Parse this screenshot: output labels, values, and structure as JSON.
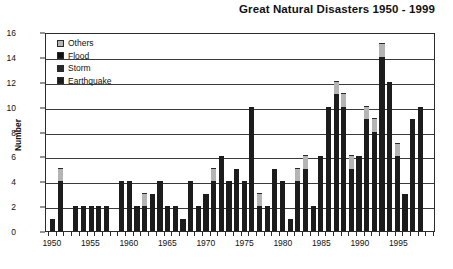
{
  "chart_data": {
    "type": "bar",
    "title": "Great Natural Disasters 1950 - 1999",
    "xlabel": "",
    "ylabel": "Number",
    "ylim": [
      0,
      16
    ],
    "ytick_step": 2,
    "yticks": [
      "16",
      "14",
      "12",
      "10",
      "8",
      "6",
      "4",
      "2",
      "0"
    ],
    "xticks": [
      "1950",
      "1955",
      "1960",
      "1965",
      "1970",
      "1975",
      "1980",
      "1985",
      "1990",
      "1995"
    ],
    "grid": true,
    "legend_position": "upper-left-inside",
    "stacked": true,
    "categories": [
      "1950",
      "1951",
      "1952",
      "1953",
      "1954",
      "1955",
      "1956",
      "1957",
      "1958",
      "1959",
      "1960",
      "1961",
      "1962",
      "1963",
      "1964",
      "1965",
      "1966",
      "1967",
      "1968",
      "1969",
      "1970",
      "1971",
      "1972",
      "1973",
      "1974",
      "1975",
      "1976",
      "1977",
      "1978",
      "1979",
      "1980",
      "1981",
      "1982",
      "1983",
      "1984",
      "1985",
      "1986",
      "1987",
      "1988",
      "1989",
      "1990",
      "1991",
      "1992",
      "1993",
      "1994",
      "1995",
      "1996",
      "1997",
      "1998",
      "1999"
    ],
    "series": [
      {
        "name": "Earthquake",
        "color": "#1c1c1c",
        "values": [
          1,
          4,
          0,
          2,
          2,
          2,
          2,
          2,
          0,
          4,
          4,
          2,
          2,
          3,
          4,
          2,
          2,
          1,
          4,
          2,
          3,
          4,
          6,
          4,
          5,
          4,
          10,
          2,
          2,
          5,
          4,
          1,
          4,
          5,
          2,
          6,
          10,
          11,
          10,
          5,
          6,
          9,
          8,
          14,
          12,
          6,
          3,
          9,
          10,
          0
        ]
      },
      {
        "name": "Others",
        "color": "#b4b4b4",
        "values": [
          0,
          1,
          0,
          0,
          0,
          0,
          0,
          0,
          0,
          0,
          0,
          0,
          1,
          0,
          0,
          0,
          0,
          0,
          0,
          0,
          0,
          1,
          0,
          0,
          0,
          0,
          0,
          1,
          0,
          0,
          0,
          0,
          1,
          1,
          0,
          0,
          0,
          1,
          1,
          1,
          0,
          1,
          1,
          1,
          0,
          1,
          0,
          0,
          0,
          0
        ]
      }
    ],
    "totals": [
      1,
      5,
      0,
      2,
      2,
      2,
      2,
      2,
      0,
      4,
      4,
      2,
      3,
      3,
      4,
      2,
      2,
      1,
      4,
      2,
      3,
      5,
      6,
      4,
      5,
      4,
      10,
      3,
      2,
      5,
      4,
      1,
      5,
      6,
      2,
      6,
      10,
      12,
      11,
      6,
      6,
      10,
      9,
      15,
      12,
      7,
      3,
      9,
      10,
      0
    ],
    "bars": [
      {
        "year": "1950",
        "earthquake": 1,
        "others": 0
      },
      {
        "year": "1951",
        "earthquake": 4,
        "others": 1
      },
      {
        "year": "1952",
        "earthquake": 0,
        "others": 0
      },
      {
        "year": "1953",
        "earthquake": 2,
        "others": 0
      },
      {
        "year": "1954",
        "earthquake": 2,
        "others": 0
      },
      {
        "year": "1955",
        "earthquake": 2,
        "others": 0
      },
      {
        "year": "1956",
        "earthquake": 2,
        "others": 0
      },
      {
        "year": "1957",
        "earthquake": 2,
        "others": 0
      },
      {
        "year": "1958",
        "earthquake": 0,
        "others": 0
      },
      {
        "year": "1959",
        "earthquake": 4,
        "others": 0
      },
      {
        "year": "1960",
        "earthquake": 4,
        "others": 0
      },
      {
        "year": "1961",
        "earthquake": 2,
        "others": 0
      },
      {
        "year": "1962",
        "earthquake": 2,
        "others": 1
      },
      {
        "year": "1963",
        "earthquake": 3,
        "others": 0
      },
      {
        "year": "1964",
        "earthquake": 4,
        "others": 0
      },
      {
        "year": "1965",
        "earthquake": 2,
        "others": 0
      },
      {
        "year": "1966",
        "earthquake": 2,
        "others": 0
      },
      {
        "year": "1967",
        "earthquake": 1,
        "others": 0
      },
      {
        "year": "1968",
        "earthquake": 4,
        "others": 0
      },
      {
        "year": "1969",
        "earthquake": 2,
        "others": 0
      },
      {
        "year": "1970",
        "earthquake": 3,
        "others": 0
      },
      {
        "year": "1971",
        "earthquake": 4,
        "others": 1
      },
      {
        "year": "1972",
        "earthquake": 6,
        "others": 0
      },
      {
        "year": "1973",
        "earthquake": 4,
        "others": 0
      },
      {
        "year": "1974",
        "earthquake": 5,
        "others": 0
      },
      {
        "year": "1975",
        "earthquake": 4,
        "others": 0
      },
      {
        "year": "1976",
        "earthquake": 10,
        "others": 0
      },
      {
        "year": "1977",
        "earthquake": 2,
        "others": 1
      },
      {
        "year": "1978",
        "earthquake": 2,
        "others": 0
      },
      {
        "year": "1979",
        "earthquake": 5,
        "others": 0
      },
      {
        "year": "1980",
        "earthquake": 4,
        "others": 0
      },
      {
        "year": "1981",
        "earthquake": 1,
        "others": 0
      },
      {
        "year": "1982",
        "earthquake": 4,
        "others": 1
      },
      {
        "year": "1983",
        "earthquake": 5,
        "others": 1
      },
      {
        "year": "1984",
        "earthquake": 2,
        "others": 0
      },
      {
        "year": "1985",
        "earthquake": 6,
        "others": 0
      },
      {
        "year": "1986",
        "earthquake": 10,
        "others": 0
      },
      {
        "year": "1987",
        "earthquake": 11,
        "others": 1
      },
      {
        "year": "1988",
        "earthquake": 10,
        "others": 1
      },
      {
        "year": "1989",
        "earthquake": 5,
        "others": 1
      },
      {
        "year": "1990",
        "earthquake": 6,
        "others": 0
      },
      {
        "year": "1991",
        "earthquake": 9,
        "others": 1
      },
      {
        "year": "1992",
        "earthquake": 8,
        "others": 1
      },
      {
        "year": "1993",
        "earthquake": 14,
        "others": 1
      },
      {
        "year": "1994",
        "earthquake": 12,
        "others": 0
      },
      {
        "year": "1995",
        "earthquake": 6,
        "others": 1
      },
      {
        "year": "1996",
        "earthquake": 3,
        "others": 0
      },
      {
        "year": "1997",
        "earthquake": 9,
        "others": 0
      },
      {
        "year": "1998",
        "earthquake": 10,
        "others": 0
      },
      {
        "year": "1999",
        "earthquake": 0,
        "others": 0
      }
    ]
  },
  "legend": {
    "items": [
      {
        "label": "Others",
        "color": "#b4b4b4"
      },
      {
        "label": "Flood",
        "color": "#101010"
      },
      {
        "label": "Storm",
        "color": "#2a2a2a"
      },
      {
        "label": "Earthquake",
        "color": "#1c1c1c"
      }
    ]
  }
}
